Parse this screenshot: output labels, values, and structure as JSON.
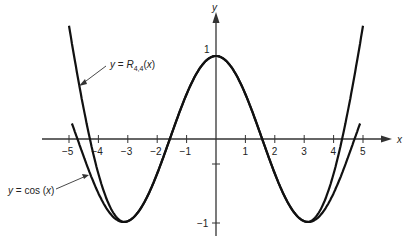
{
  "chart_data": {
    "type": "line",
    "title": "",
    "xlabel": "x",
    "ylabel": "y",
    "xlim": [
      -5.2,
      5.6
    ],
    "ylim": [
      -1.2,
      1.3
    ],
    "grid": false,
    "x_ticks": [
      -5,
      -4,
      -3,
      -2,
      -1,
      1,
      2,
      3,
      4,
      5
    ],
    "y_ticks": [
      1,
      -1
    ],
    "series": [
      {
        "name": "y = cos (x)",
        "x": [
          -4.9,
          -4,
          -3,
          -2,
          -1,
          0,
          1,
          2,
          3,
          4,
          4.9
        ],
        "values": [
          0.19,
          -0.65,
          -0.99,
          -0.42,
          0.54,
          1,
          0.54,
          -0.42,
          -0.99,
          -0.65,
          0.19
        ]
      },
      {
        "name": "y = R4,4(x)",
        "x": [
          -5,
          -4.5,
          -4,
          -3,
          -2,
          -1,
          0,
          1,
          2,
          3,
          4,
          4.5,
          5
        ],
        "values": [
          0.95,
          0.05,
          -0.6,
          -0.99,
          -0.42,
          0.54,
          1,
          0.54,
          -0.42,
          -0.99,
          -0.6,
          0.05,
          0.95
        ]
      }
    ],
    "annotations": [
      {
        "text": "y = R4,4(x)",
        "target_series": "R4,4"
      },
      {
        "text": "y = cos (x)",
        "target_series": "cos"
      }
    ]
  },
  "labels": {
    "x_axis": "x",
    "y_axis": "y",
    "y_one": "1",
    "y_neg_one": "−1",
    "x_ticks": [
      "−5",
      "−4",
      "−3",
      "−2",
      "−1",
      "1",
      "2",
      "3",
      "4",
      "5"
    ],
    "r44_prefix": "y = R",
    "r44_sub": "4,4",
    "r44_suffix": "(x)",
    "cos_label": "y = cos (x)"
  }
}
